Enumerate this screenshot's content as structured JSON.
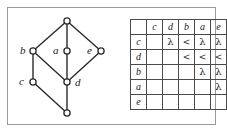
{
  "figure": {
    "frame_color": "#9a9a9a",
    "line_color": "#2a2a2a",
    "text_color": "#1a1a1a"
  },
  "graph": {
    "name": "lattice-diagram",
    "nodes": [
      {
        "id": "top",
        "label": "",
        "x": 67,
        "y": 21
      },
      {
        "id": "b",
        "label": "b",
        "x": 33,
        "y": 51,
        "label_x": 20,
        "label_y": 45
      },
      {
        "id": "a",
        "label": "a",
        "x": 67,
        "y": 51,
        "label_x": 53,
        "label_y": 45
      },
      {
        "id": "e",
        "label": "e",
        "x": 101,
        "y": 51,
        "label_x": 87,
        "label_y": 45
      },
      {
        "id": "c",
        "label": "c",
        "x": 33,
        "y": 82,
        "label_x": 19,
        "label_y": 76
      },
      {
        "id": "d",
        "label": "d",
        "x": 67,
        "y": 82,
        "label_x": 75,
        "label_y": 77
      },
      {
        "id": "bottom",
        "label": "",
        "x": 67,
        "y": 113
      }
    ],
    "edges": [
      {
        "from": "top",
        "to": "b"
      },
      {
        "from": "top",
        "to": "a"
      },
      {
        "from": "top",
        "to": "e"
      },
      {
        "from": "b",
        "to": "d"
      },
      {
        "from": "b",
        "to": "c"
      },
      {
        "from": "a",
        "to": "d"
      },
      {
        "from": "e",
        "to": "d"
      },
      {
        "from": "c",
        "to": "bottom"
      },
      {
        "from": "d",
        "to": "bottom"
      }
    ]
  },
  "table": {
    "name": "relation-table",
    "corner_label": "",
    "column_headers": [
      "c",
      "d",
      "b",
      "a",
      "e"
    ],
    "row_headers": [
      "c",
      "d",
      "b",
      "a",
      "e"
    ],
    "rows": [
      {
        "header": "c",
        "cells": [
          "",
          "λ",
          "<",
          "λ",
          "λ"
        ]
      },
      {
        "header": "d",
        "cells": [
          "",
          "",
          "<",
          "<",
          "<"
        ]
      },
      {
        "header": "b",
        "cells": [
          "",
          "",
          "",
          "λ",
          "λ"
        ]
      },
      {
        "header": "a",
        "cells": [
          "",
          "",
          "",
          "",
          "λ"
        ]
      },
      {
        "header": "e",
        "cells": [
          "",
          "",
          "",
          "",
          ""
        ]
      }
    ]
  }
}
